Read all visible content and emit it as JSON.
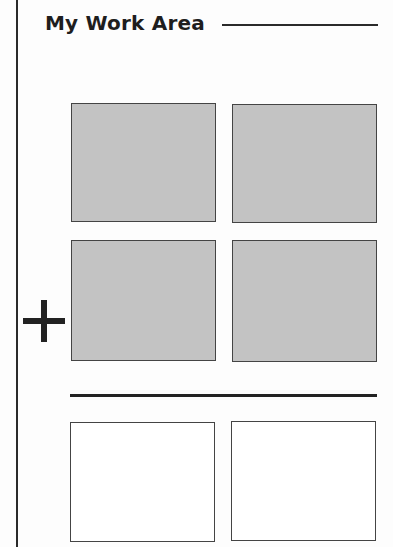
{
  "worksheet": {
    "title": "My Work Area",
    "operator_symbol": "+",
    "operator_icon": "plus-icon",
    "colors": {
      "filled_box": "#c3c3c3",
      "empty_box": "#ffffff",
      "line": "#222222"
    },
    "addend_rows": [
      {
        "boxes": [
          {
            "state": "filled"
          },
          {
            "state": "filled"
          }
        ]
      },
      {
        "boxes": [
          {
            "state": "filled"
          },
          {
            "state": "filled"
          }
        ]
      }
    ],
    "answer_row": {
      "boxes": [
        {
          "state": "empty"
        },
        {
          "state": "empty"
        }
      ]
    }
  }
}
